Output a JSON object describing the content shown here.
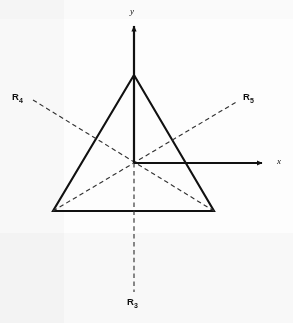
{
  "figure": {
    "background_color": "#fdfdfd",
    "line_color": "#111111",
    "dashed_color": "#333333"
  },
  "axes": {
    "x_label": "x",
    "y_label": "y",
    "origin_label": ""
  },
  "rays": [
    {
      "id": "R3",
      "letter": "R",
      "subscript": "3",
      "label": "R3"
    },
    {
      "id": "R4",
      "letter": "R",
      "subscript": "4",
      "label": "R4"
    },
    {
      "id": "R5",
      "letter": "R",
      "subscript": "5",
      "label": "R5"
    }
  ],
  "geometry": {
    "origin": {
      "x": 134,
      "y": 163
    },
    "triangle_vertices": [
      {
        "name": "apex",
        "x": 134,
        "y": 75
      },
      {
        "name": "bottom-left",
        "x": 53,
        "y": 211
      },
      {
        "name": "bottom-right",
        "x": 214,
        "y": 211
      }
    ],
    "x_axis": {
      "from_x": 134,
      "from_y": 163,
      "to_x": 266,
      "to_y": 163
    },
    "y_axis": {
      "from_x": 134,
      "from_y": 163,
      "to_x": 134,
      "to_y": 22
    },
    "ray_R3": {
      "from_x": 134,
      "from_y": 163,
      "to_x": 134,
      "to_y": 292
    },
    "ray_R4": {
      "from_x": 33,
      "from_y": 100,
      "to_x": 214,
      "to_y": 211
    },
    "ray_R5": {
      "from_x": 53,
      "from_y": 211,
      "to_x": 238,
      "to_y": 101
    }
  },
  "labels": {
    "r4_position": {
      "x": 13,
      "y": 94
    },
    "r5_position": {
      "x": 243,
      "y": 94
    },
    "r3_position": {
      "x": 128,
      "y": 298
    },
    "x_position": {
      "x": 276,
      "y": 159
    },
    "y_position": {
      "x": 130,
      "y": 9
    }
  }
}
